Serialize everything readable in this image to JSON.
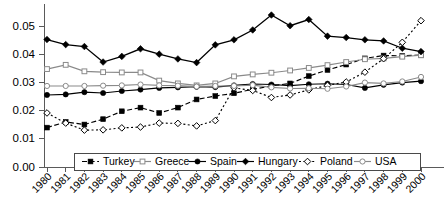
{
  "chart_data": {
    "type": "line",
    "title": "",
    "subtitle": "",
    "xlabel": "",
    "ylabel": "",
    "grid": false,
    "legend_position": "bottom-inside",
    "x": [
      "1980",
      "1981",
      "1982",
      "1983",
      "1984",
      "1985",
      "1986",
      "1987",
      "1988",
      "1989",
      "1990",
      "1991",
      "1992",
      "1993",
      "1994",
      "1995",
      "1996",
      "1997",
      "1998",
      "1999",
      "2000"
    ],
    "xlim": [
      "1980",
      "2000"
    ],
    "ylim": [
      0.0,
      0.055
    ],
    "yticks": [
      0.0,
      0.01,
      0.02,
      0.03,
      0.04,
      0.05
    ],
    "ytick_labels": [
      "0.00",
      "0.01",
      "0.02",
      "0.03",
      "0.04",
      "0.05"
    ],
    "series": [
      {
        "name": "Turkey",
        "marker": "filled-square",
        "line": "solid",
        "color": "#000000",
        "values": [
          0.014,
          0.016,
          0.0151,
          0.017,
          0.0198,
          0.0211,
          0.0192,
          0.0211,
          0.024,
          0.0252,
          0.0262,
          0.0276,
          0.0288,
          0.0297,
          0.0323,
          0.0345,
          0.0364,
          0.0386,
          0.0396,
          0.0395,
          0.0398
        ]
      },
      {
        "name": "Greece",
        "marker": "open-square",
        "line": "solid",
        "color": "#8a8a8a",
        "values": [
          0.0348,
          0.0363,
          0.034,
          0.0337,
          0.0336,
          0.0336,
          0.0307,
          0.0297,
          0.029,
          0.0297,
          0.0322,
          0.0329,
          0.0335,
          0.0343,
          0.0352,
          0.0362,
          0.0373,
          0.0383,
          0.0386,
          0.0392,
          0.0397
        ]
      },
      {
        "name": "Spain",
        "marker": "filled-circle",
        "line": "solid",
        "color": "#000000",
        "values": [
          0.0256,
          0.0258,
          0.0266,
          0.0263,
          0.027,
          0.0275,
          0.0281,
          0.0283,
          0.0285,
          0.0284,
          0.029,
          0.0295,
          0.0293,
          0.0289,
          0.0294,
          0.0296,
          0.0293,
          0.0281,
          0.0292,
          0.03,
          0.0305
        ]
      },
      {
        "name": "Hungary",
        "marker": "filled-diamond",
        "line": "solid",
        "color": "#000000",
        "values": [
          0.0453,
          0.0435,
          0.0428,
          0.0373,
          0.0393,
          0.042,
          0.0401,
          0.0384,
          0.0371,
          0.0434,
          0.0452,
          0.0487,
          0.054,
          0.0502,
          0.0524,
          0.0465,
          0.046,
          0.0452,
          0.0448,
          0.0422,
          0.041
        ]
      },
      {
        "name": "Poland",
        "marker": "open-diamond",
        "line": "dotted",
        "color": "#000000",
        "values": [
          0.0192,
          0.0156,
          0.0131,
          0.0132,
          0.0139,
          0.0142,
          0.0156,
          0.0155,
          0.0146,
          0.0165,
          0.0281,
          0.0272,
          0.0247,
          0.0256,
          0.0274,
          0.029,
          0.0302,
          0.0337,
          0.0385,
          0.0443,
          0.052
        ]
      },
      {
        "name": "USA",
        "marker": "open-circle",
        "line": "solid",
        "color": "#8a8a8a",
        "values": [
          0.0288,
          0.0288,
          0.0288,
          0.0289,
          0.029,
          0.0293,
          0.029,
          0.0289,
          0.0286,
          0.0288,
          0.0288,
          0.0291,
          0.0283,
          0.0279,
          0.028,
          0.0278,
          0.0286,
          0.03,
          0.0297,
          0.0304,
          0.032
        ]
      }
    ],
    "legend": [
      {
        "label": "Turkey",
        "marker": "filled-square",
        "line": "solid",
        "color": "#000000"
      },
      {
        "label": "Greece",
        "marker": "open-square",
        "line": "solid",
        "color": "#8a8a8a"
      },
      {
        "label": "Spain",
        "marker": "filled-circle",
        "line": "solid",
        "color": "#000000"
      },
      {
        "label": "Hungary",
        "marker": "filled-diamond",
        "line": "solid",
        "color": "#000000"
      },
      {
        "label": "Poland",
        "marker": "open-diamond",
        "line": "dotted",
        "color": "#000000"
      },
      {
        "label": "USA",
        "marker": "open-circle",
        "line": "solid",
        "color": "#8a8a8a"
      }
    ]
  }
}
